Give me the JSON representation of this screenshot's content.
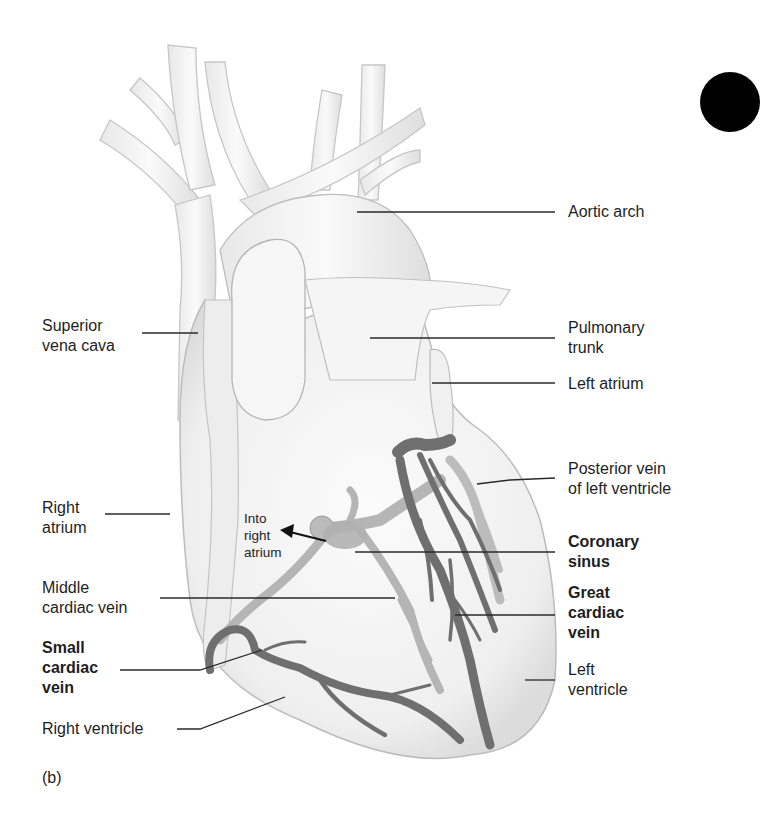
{
  "figure": {
    "panel_label": "(b)",
    "labels": {
      "aortic_arch": "Aortic arch",
      "pulmonary_trunk": "Pulmonary\ntrunk",
      "left_atrium": "Left atrium",
      "posterior_vein": "Posterior vein\nof left ventricle",
      "coronary_sinus": "Coronary\nsinus",
      "great_cardiac_vein": "Great\ncardiac\nvein",
      "left_ventricle": "Left\nventricle",
      "superior_vena_cava": "Superior\nvena cava",
      "right_atrium": "Right\natrium",
      "into_right_atrium": "Into\nright\natrium",
      "middle_cardiac_vein": "Middle\ncardiac vein",
      "small_cardiac_vein": "Small\ncardiac\nvein",
      "right_ventricle": "Right ventricle"
    },
    "colors": {
      "background": "#ffffff",
      "heart_fill": "#f2f2f2",
      "heart_outline": "#b8b8b8",
      "vein_dark": "#6b6b6b",
      "vein_light": "#a9a9a9",
      "leader_line": "#2a2a2a",
      "text": "#1e1e1e"
    }
  }
}
